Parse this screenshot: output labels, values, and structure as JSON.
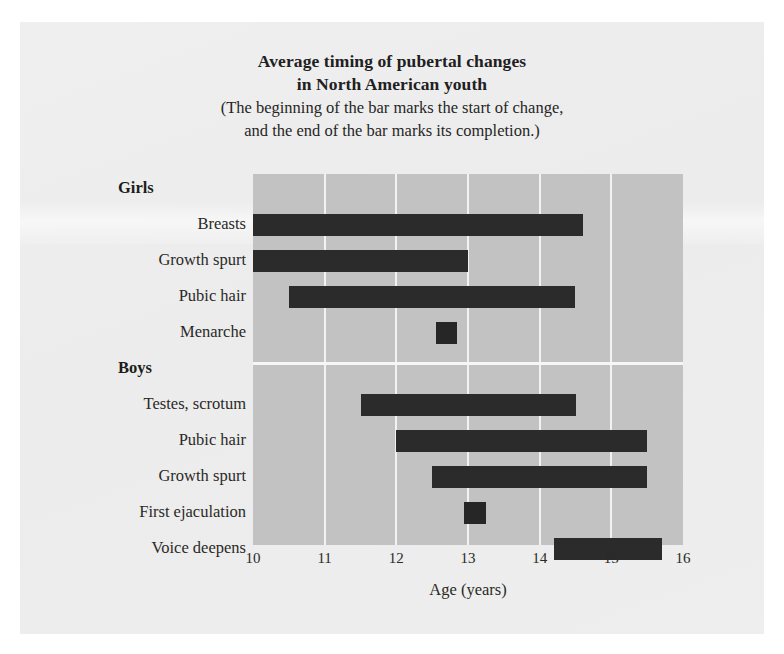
{
  "chart_data": {
    "type": "bar",
    "orientation": "horizontal-range",
    "title": "Average timing of pubertal changes in North American youth",
    "title_lines": [
      "Average timing of pubertal changes",
      "in North American youth"
    ],
    "subtitle_lines": [
      "(The beginning of the bar marks the start of change,",
      "and the end of the bar marks its completion.)"
    ],
    "xlabel": "Age (years)",
    "ylabel": "",
    "xlim": [
      10,
      16
    ],
    "xticks": [
      10,
      11,
      12,
      13,
      14,
      15,
      16
    ],
    "xtick_labels": [
      "10",
      "11",
      "12",
      "13",
      "14",
      "15",
      "16"
    ],
    "grid": true,
    "legend": "none",
    "groups": [
      {
        "name": "Girls",
        "items": [
          {
            "label": "Breasts",
            "start": 10.0,
            "end": 14.6
          },
          {
            "label": "Growth spurt",
            "start": 10.0,
            "end": 13.0
          },
          {
            "label": "Pubic hair",
            "start": 10.5,
            "end": 14.5
          },
          {
            "label": "Menarche",
            "start": 12.55,
            "end": 12.85
          }
        ]
      },
      {
        "name": "Boys",
        "items": [
          {
            "label": "Testes, scrotum",
            "start": 11.5,
            "end": 14.5
          },
          {
            "label": "Pubic hair",
            "start": 12.0,
            "end": 15.5
          },
          {
            "label": "Growth spurt",
            "start": 12.5,
            "end": 15.5
          },
          {
            "label": "First ejaculation",
            "start": 12.95,
            "end": 13.25
          },
          {
            "label": "Voice deepens",
            "start": 14.2,
            "end": 15.7
          }
        ]
      }
    ],
    "colors": {
      "bar": "#2b2b2b",
      "plot_background": "#c2c2c2",
      "page_background": "#eeeeee",
      "gridline": "#f2f2f2",
      "text": "#2a2a26"
    }
  }
}
